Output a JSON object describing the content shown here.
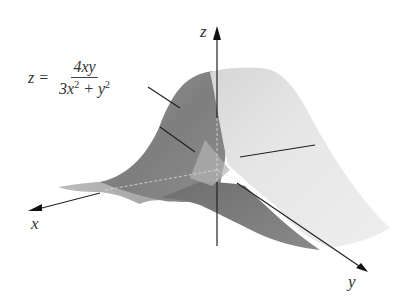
{
  "figure": {
    "equation": {
      "lhs": "z =",
      "numerator": "4xy",
      "denominator_parts": [
        "3x",
        "2",
        " + y",
        "2"
      ]
    },
    "axes": {
      "x_label": "x",
      "y_label": "y",
      "z_label": "z"
    },
    "colors": {
      "background": "#ffffff",
      "surface_dark": "#8a8a8a",
      "surface_mid": "#a8a8a8",
      "surface_light": "#e2e2e2",
      "surface_lightest": "#efefef",
      "axis": "#222222",
      "text": "#333333"
    }
  }
}
